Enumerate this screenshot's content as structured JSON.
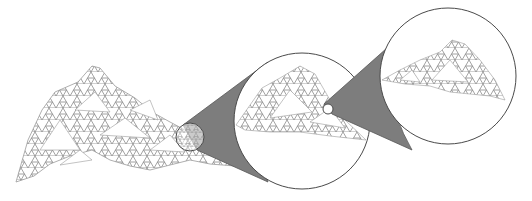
{
  "figure": {
    "colors": {
      "background": "#ffffff",
      "fractal_stroke": "#8a8a8a",
      "cone_fill": "#7d7d7d",
      "circle_stroke": "#4a4a4a",
      "lens_fill": "#ffffff"
    },
    "stages": [
      {
        "name": "full-fractal-surface",
        "level": 1
      },
      {
        "name": "first-magnification",
        "level": 2,
        "lens_center": [
          190,
          137
        ],
        "lens_radius": 14,
        "view_center": [
          302,
          121
        ],
        "view_radius": 69
      },
      {
        "name": "second-magnification",
        "level": 3,
        "lens_center": [
          328,
          109
        ],
        "lens_radius": 5,
        "view_center": [
          448,
          76
        ],
        "view_radius": 69
      }
    ]
  }
}
